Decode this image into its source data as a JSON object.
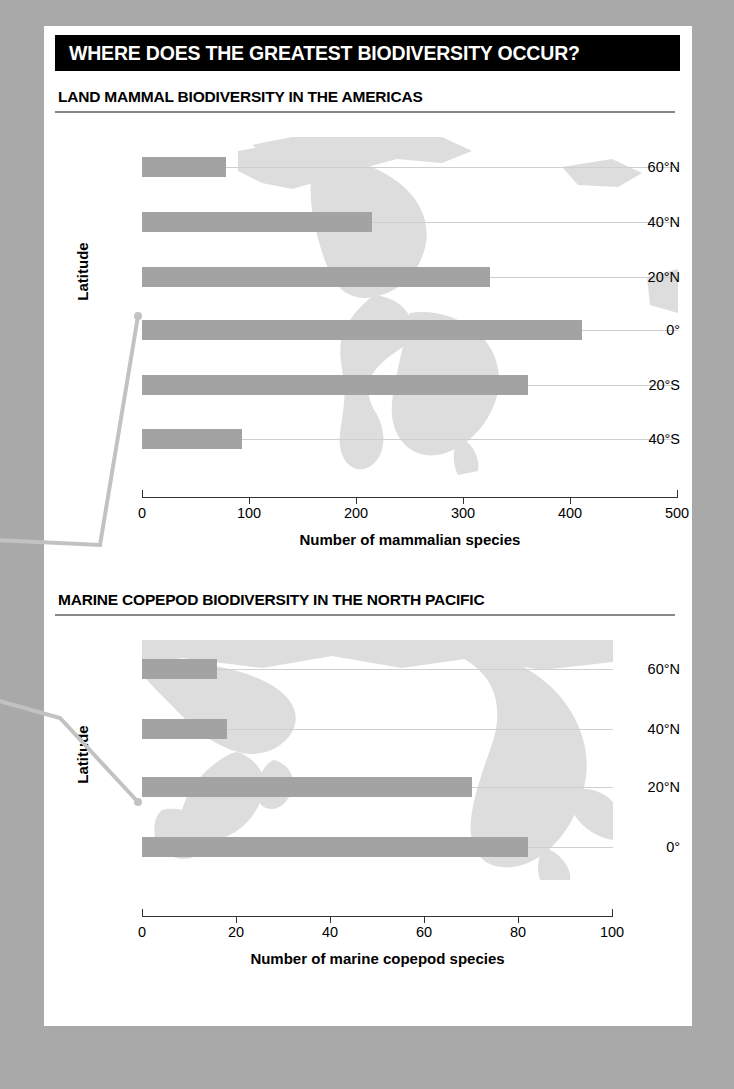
{
  "header": {
    "title": "WHERE DOES THE GREATEST BIODIVERSITY OCCUR?"
  },
  "colors": {
    "page_background": "#a9a9a9",
    "card_background": "#ffffff",
    "header_background": "#000000",
    "header_text": "#ffffff",
    "bar_fill": "#a3a3a3",
    "map_fill": "#dcdcdc",
    "grid_line": "#cfcfcf",
    "axis": "#333333",
    "callout_line": "#c2c2c2"
  },
  "callout": {
    "name": "leader-line",
    "description": "gray leader lines from left margin to the 20 degrees North tick of each chart"
  },
  "chart_data": [
    {
      "type": "bar",
      "orientation": "horizontal",
      "title": "LAND MAMMAL BIODIVERSITY IN THE AMERICAS",
      "xlabel": "Number of mammalian species",
      "ylabel": "Latitude",
      "categories": [
        "60°N",
        "40°N",
        "20°N",
        "0°",
        "20°S",
        "40°S"
      ],
      "values": [
        78,
        215,
        325,
        410,
        360,
        93
      ],
      "xlim": [
        0,
        500
      ],
      "xticks": [
        0,
        100,
        200,
        300,
        400,
        500
      ],
      "xticklabels": [
        "0",
        "100",
        "200",
        "300",
        "400",
        "500"
      ],
      "grid": true,
      "legend": "none",
      "background_map": "world map of the Americas, light gray silhouette"
    },
    {
      "type": "bar",
      "orientation": "horizontal",
      "title": "MARINE COPEPOD BIODIVERSITY IN THE NORTH PACIFIC",
      "xlabel": "Number of marine copepod species",
      "ylabel": "Latitude",
      "categories": [
        "60°N",
        "40°N",
        "20°N",
        "0°"
      ],
      "values": [
        16,
        18,
        70,
        82
      ],
      "xlim": [
        0,
        100
      ],
      "xticks": [
        0,
        20,
        40,
        60,
        80,
        100
      ],
      "xticklabels": [
        "0",
        "20",
        "40",
        "60",
        "80",
        "100"
      ],
      "grid": true,
      "legend": "none",
      "background_map": "world map centered on the North Pacific, light gray silhouette"
    }
  ]
}
